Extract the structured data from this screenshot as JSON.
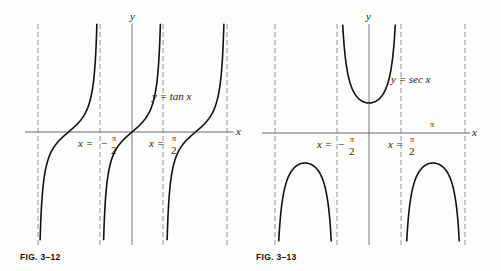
{
  "figures": [
    {
      "id": "fig-3-12",
      "caption": "FIG. 3–12",
      "curve_label": "y = tan x",
      "axis_labels": {
        "x": "x",
        "y": "y"
      },
      "asymptote_labels": [
        {
          "lhs": "x =",
          "sign": "−",
          "num": "π",
          "den": "2"
        },
        {
          "lhs": "x =",
          "sign": "",
          "num": "π",
          "den": "2"
        }
      ]
    },
    {
      "id": "fig-3-13",
      "caption": "FIG. 3–13",
      "curve_label": "y = sec x",
      "axis_labels": {
        "x": "x",
        "y": "y"
      },
      "extra_label": "π",
      "asymptote_labels": [
        {
          "lhs": "x =",
          "sign": "−",
          "num": "π",
          "den": "2"
        },
        {
          "lhs": "x =",
          "sign": "",
          "num": "π",
          "den": "2"
        }
      ]
    }
  ],
  "chart_data": [
    {
      "type": "line",
      "title": "FIG. 3–12",
      "series": [
        {
          "name": "y = tan x",
          "function": "tan(x)"
        }
      ],
      "xlabel": "x",
      "ylabel": "y",
      "asymptotes": [
        "-3π/2",
        "-π/2",
        "π/2",
        "3π/2"
      ],
      "annotations": [
        "x = −π/2",
        "x = π/2",
        "y = tan x"
      ],
      "grid": false
    },
    {
      "type": "line",
      "title": "FIG. 3–13",
      "series": [
        {
          "name": "y = sec x",
          "function": "sec(x)"
        }
      ],
      "xlabel": "x",
      "ylabel": "y",
      "asymptotes": [
        "-3π/2",
        "-π/2",
        "π/2",
        "3π/2"
      ],
      "annotations": [
        "x = −π/2",
        "x = π/2",
        "y = sec x",
        "π"
      ],
      "grid": false
    }
  ]
}
